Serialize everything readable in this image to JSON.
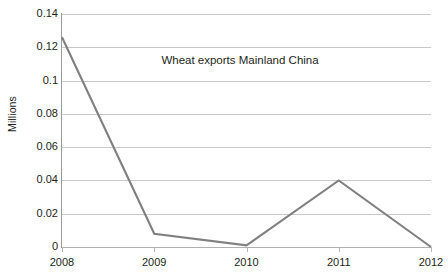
{
  "chart_data": {
    "type": "line",
    "title": "Wheat exports Mainland China",
    "title_position": "inside-plot-top-center",
    "xlabel": "",
    "ylabel": "Millions",
    "categories": [
      "2008",
      "2009",
      "2010",
      "2011",
      "2012"
    ],
    "values": [
      0.126,
      0.008,
      0.001,
      0.04,
      0.0
    ],
    "series": [
      {
        "name": "Wheat exports Mainland China",
        "values": [
          0.126,
          0.008,
          0.001,
          0.04,
          0.0
        ],
        "color": "#808080"
      }
    ],
    "ylim": [
      0,
      0.14
    ],
    "ytick_values": [
      0,
      0.02,
      0.04,
      0.06,
      0.08,
      0.1,
      0.12,
      0.14
    ],
    "ytick_labels": [
      "0",
      "0.02",
      "0.04",
      "0.06",
      "0.08",
      "0.1",
      "0.12",
      "0.14"
    ],
    "xtick_labels": [
      "2008",
      "2009",
      "2010",
      "2011",
      "2012"
    ],
    "grid": true,
    "grid_axis": "y",
    "legend": false,
    "legend_position": "none",
    "markers": false,
    "colors": {
      "line": "#808080",
      "gridline": "#c9c9c9",
      "axis": "#9a9a9a",
      "text": "#231f20",
      "background": "#ffffff"
    }
  }
}
